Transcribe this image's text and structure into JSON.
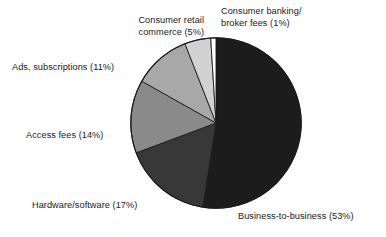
{
  "chart_data": {
    "type": "pie",
    "title": "",
    "subtitle": "",
    "xlabel": "",
    "ylabel": "",
    "legend_position": "none",
    "grid": false,
    "start_angle_deg": 0,
    "direction": "clockwise",
    "units": "percent",
    "categories": [
      "Business-to-business",
      "Hardware/software",
      "Access fees",
      "Ads, subscriptions",
      "Consumer retail commerce",
      "Consumer banking/broker fees"
    ],
    "values": [
      53,
      17,
      14,
      11,
      5,
      1
    ],
    "colors": [
      "#1c1c1c",
      "#383838",
      "#8a8a8a",
      "#a8a8a8",
      "#d2d2d2",
      "#ffffff"
    ],
    "slices": [
      {
        "name": "Business-to-business",
        "value": 53,
        "label": "Business-to-business (53%)",
        "color": "#1c1c1c",
        "start_deg": 0,
        "end_deg": 190.8
      },
      {
        "name": "Hardware/software",
        "value": 17,
        "label": "Hardware/software (17%)",
        "color": "#383838",
        "start_deg": 190.8,
        "end_deg": 252.0
      },
      {
        "name": "Access fees",
        "value": 14,
        "label": "Access fees (14%)",
        "color": "#8a8a8a",
        "start_deg": 252.0,
        "end_deg": 302.4
      },
      {
        "name": "Ads, subscriptions",
        "value": 11,
        "label": "Ads, subscriptions (11%)",
        "color": "#a8a8a8",
        "start_deg": 302.4,
        "end_deg": 342.0
      },
      {
        "name": "Consumer retail commerce",
        "value": 5,
        "label": "Consumer retail\ncommerce (5%)",
        "color": "#d2d2d2",
        "start_deg": 342.0,
        "end_deg": 360.0
      },
      {
        "name": "Consumer banking/broker fees",
        "value": 1,
        "label": "Consumer banking/\nbroker fees (1%)",
        "color": "#ffffff",
        "start_deg": 356.4,
        "end_deg": 360.0
      }
    ]
  },
  "labels": {
    "banking": "Consumer banking/\nbroker fees (1%)",
    "retail": "Consumer retail\ncommerce (5%)",
    "ads": "Ads, subscriptions (11%)",
    "access": "Access fees (14%)",
    "hardware": "Hardware/software (17%)",
    "b2b": "Business-to-business (53%)"
  }
}
